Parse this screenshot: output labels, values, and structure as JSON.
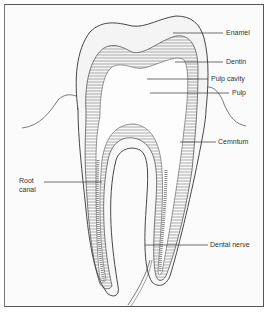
{
  "figure": {
    "labels": [
      {
        "id": "enamel",
        "text": "Enamel"
      },
      {
        "id": "dentin",
        "text": "Dentin"
      },
      {
        "id": "pulp_cavity",
        "text": "Pulp cavity"
      },
      {
        "id": "pulp",
        "text": "Pulp"
      },
      {
        "id": "cemntum",
        "text": "Cemntum"
      },
      {
        "id": "root_canal_line1",
        "text": "Root"
      },
      {
        "id": "root_canal_line2",
        "text": "canal"
      },
      {
        "id": "dental_nerve",
        "text": "Dental nerve"
      }
    ]
  },
  "colors": {
    "line": "#333333",
    "hatch": "#666666",
    "background": "#fbfbfb",
    "frame": "#555555"
  }
}
